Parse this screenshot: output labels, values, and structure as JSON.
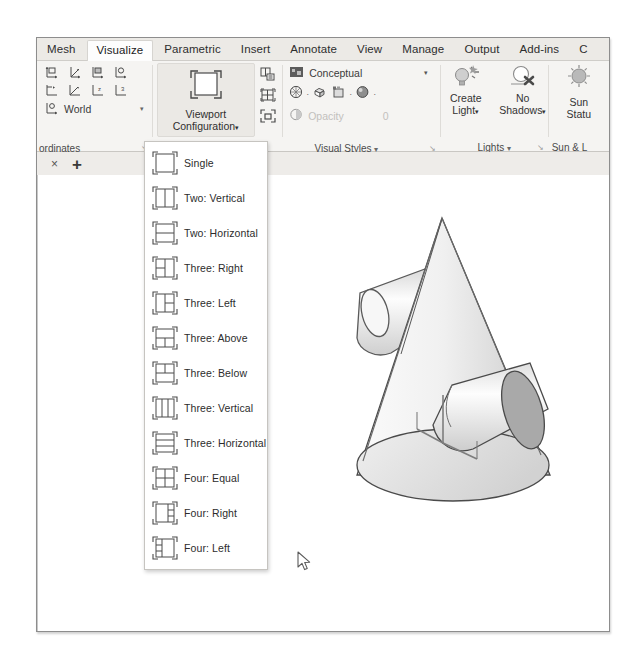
{
  "app": {
    "title": "AutoCAD Ribbon - Visualize Tab"
  },
  "ribbon": {
    "tabs": [
      {
        "label": "Mesh",
        "active": false
      },
      {
        "label": "Visualize",
        "active": true
      },
      {
        "label": "Parametric",
        "active": false
      },
      {
        "label": "Insert",
        "active": false
      },
      {
        "label": "Annotate",
        "active": false
      },
      {
        "label": "View",
        "active": false
      },
      {
        "label": "Manage",
        "active": false
      },
      {
        "label": "Output",
        "active": false
      },
      {
        "label": "Add-ins",
        "active": false
      },
      {
        "label": "C",
        "active": false
      }
    ],
    "panels": {
      "coordinates": {
        "title": "ordinates",
        "dialog_launcher": "↘",
        "world_label": "World",
        "world_caret": "▾",
        "icons_row1": [
          "ucs-icon",
          "ucs-3point-icon",
          "ucs-face-icon",
          "ucs-object-icon"
        ],
        "icons_row2": [
          "ucs-origin-icon",
          "ucs-view-icon",
          "ucs-z-axis-icon",
          "ucs-named-icon"
        ],
        "world_icon": "ucs-world-icon"
      },
      "viewport": {
        "button_line1": "Viewport",
        "button_line2": "Configuration",
        "button_caret": "▾",
        "icon": "viewport-single-icon",
        "tool_icons": [
          "named-viewports-icon",
          "restore-viewports-icon",
          "join-viewports-icon"
        ]
      },
      "visual_styles": {
        "title": "Visual Styles",
        "title_caret": "▾",
        "dialog_launcher": "↘",
        "current_style": "Conceptual",
        "style_icon": "visual-style-icon",
        "style_caret": "▾",
        "face_icons": [
          "xray-icon",
          "shaded-box-icon",
          "edge-overlay-icon",
          "shade-sphere-icon"
        ],
        "opacity_label": "Opacity",
        "opacity_value": "0",
        "opacity_icon": "opacity-icon"
      },
      "lights": {
        "title": "Lights",
        "title_caret": "▾",
        "dialog_launcher": "↘",
        "buttons": [
          {
            "line1": "Create",
            "line2": "Light",
            "caret": "▾",
            "icon": "create-light-icon"
          },
          {
            "line1": "No",
            "line2": "Shadows",
            "caret": "▾",
            "icon": "no-shadows-icon"
          }
        ]
      },
      "sun": {
        "title": "Sun & L",
        "button_line1": "Sun",
        "button_line2": "Statu",
        "icon": "sun-status-icon"
      }
    }
  },
  "file_tabs": {
    "close_label": "×",
    "add_label": "+"
  },
  "viewport_menu": {
    "name": "viewport-configuration-menu",
    "items": [
      {
        "label": "Single",
        "icon": "layout-single-icon",
        "layout": "single"
      },
      {
        "label": "Two: Vertical",
        "icon": "layout-two-vertical-icon",
        "layout": "two-vertical"
      },
      {
        "label": "Two: Horizontal",
        "icon": "layout-two-horizontal-icon",
        "layout": "two-horizontal"
      },
      {
        "label": "Three: Right",
        "icon": "layout-three-right-icon",
        "layout": "three-right"
      },
      {
        "label": "Three: Left",
        "icon": "layout-three-left-icon",
        "layout": "three-left"
      },
      {
        "label": "Three: Above",
        "icon": "layout-three-above-icon",
        "layout": "three-above"
      },
      {
        "label": "Three: Below",
        "icon": "layout-three-below-icon",
        "layout": "three-below"
      },
      {
        "label": "Three: Vertical",
        "icon": "layout-three-vertical-icon",
        "layout": "three-vertical"
      },
      {
        "label": "Three: Horizontal",
        "icon": "layout-three-horizontal-icon",
        "layout": "three-horizontal"
      },
      {
        "label": "Four: Equal",
        "icon": "layout-four-equal-icon",
        "layout": "four-equal"
      },
      {
        "label": "Four: Right",
        "icon": "layout-four-right-icon",
        "layout": "four-right"
      },
      {
        "label": "Four: Left",
        "icon": "layout-four-left-icon",
        "layout": "four-left"
      }
    ]
  },
  "canvas": {
    "model_name": "cone-with-two-cylinders-3d-model",
    "ucs_icon": "ucs-axis-tripod-icon"
  },
  "colors": {
    "ribbon_bg": "#f5f4f2",
    "tab_bg": "#eceae6",
    "active_tab_bg": "#fdfdfd",
    "menu_bg": "#ffffff",
    "border": "#c6c4c0",
    "text": "#2c2c2c",
    "model_fill": "#f2f2f2",
    "model_shade": "#a8a8a8"
  }
}
